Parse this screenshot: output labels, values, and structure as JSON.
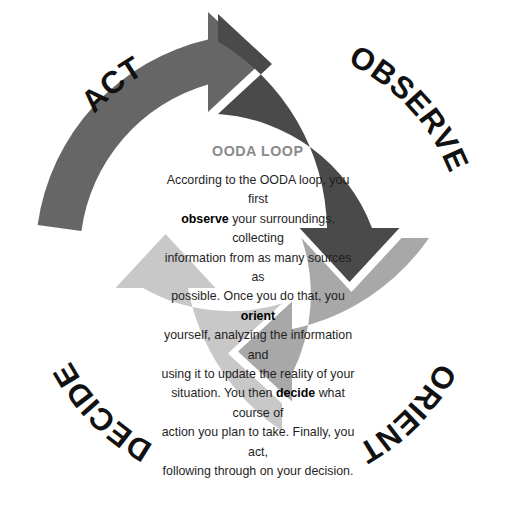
{
  "diagram": {
    "title": "OODA LOOP",
    "type": "cycle-diagram",
    "direction": "clockwise",
    "background_color": "#ffffff",
    "center": {
      "title": "OODA LOOP",
      "title_color": "#8a8a8a",
      "body_lines": [
        "According to the OODA loop, you first",
        "observe your surroundings, collecting",
        "information from as many sources as",
        "possible. Once you do that, you orient",
        "yourself, analyzing the information and",
        "using it to update the reality of your",
        "situation. You then decide what course of",
        "action you plan to take. Finally, you act,",
        "following through on your decision."
      ],
      "bold_keywords": [
        "observe",
        "orient",
        "decide",
        "act"
      ],
      "text_color": "#1f1f1f"
    },
    "segments": [
      {
        "id": "act",
        "label": "ACT",
        "position": "top-left",
        "color": "#666666",
        "label_color": "#111111",
        "order": 4,
        "arrow_direction": "points-right-into-observe"
      },
      {
        "id": "observe",
        "label": "OBSERVE",
        "position": "top-right",
        "color": "#4a4a4a",
        "label_color": "#111111",
        "order": 1,
        "arrow_direction": "points-down-into-orient"
      },
      {
        "id": "orient",
        "label": "ORIENT",
        "position": "bottom-right",
        "color": "#a8a8a8",
        "label_color": "#111111",
        "order": 2,
        "arrow_direction": "points-left-into-decide"
      },
      {
        "id": "decide",
        "label": "DECIDE",
        "position": "bottom-left",
        "color": "#c8c8c8",
        "label_color": "#111111",
        "order": 3,
        "arrow_direction": "points-up-into-act"
      }
    ]
  }
}
